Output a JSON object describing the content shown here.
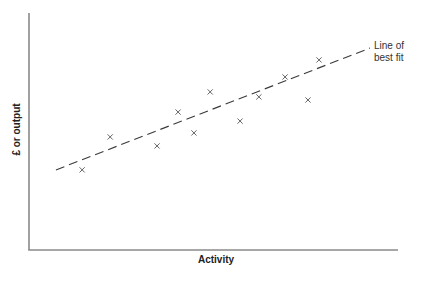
{
  "chart_data": {
    "type": "scatter",
    "title": "",
    "xlabel": "Activity",
    "ylabel": "£ or output",
    "grid": false,
    "legend": null,
    "ticks": {
      "x": [],
      "y": []
    },
    "xlim": [
      0,
      100
    ],
    "ylim": [
      0,
      100
    ],
    "points": [
      {
        "x": 14.4,
        "y": 33.8
      },
      {
        "x": 22.0,
        "y": 47.7
      },
      {
        "x": 34.7,
        "y": 43.9
      },
      {
        "x": 40.4,
        "y": 58.2
      },
      {
        "x": 44.7,
        "y": 49.4
      },
      {
        "x": 49.1,
        "y": 66.7
      },
      {
        "x": 57.2,
        "y": 54.4
      },
      {
        "x": 62.3,
        "y": 64.6
      },
      {
        "x": 69.4,
        "y": 73.0
      },
      {
        "x": 75.6,
        "y": 63.3
      },
      {
        "x": 78.6,
        "y": 80.2
      }
    ],
    "trendline": {
      "style": "dashed",
      "label": "Line of best fit",
      "start": {
        "x": 7.3,
        "y": 33.8
      },
      "end": {
        "x": 92.4,
        "y": 85.2
      }
    },
    "annotations": [
      {
        "text": "Line of best fit",
        "position": "end of trendline, right"
      }
    ],
    "marker": "x"
  },
  "labels": {
    "xlabel": "Activity",
    "ylabel": "£ or output",
    "annotation_line1": "Line of",
    "annotation_line2": "best fit"
  }
}
